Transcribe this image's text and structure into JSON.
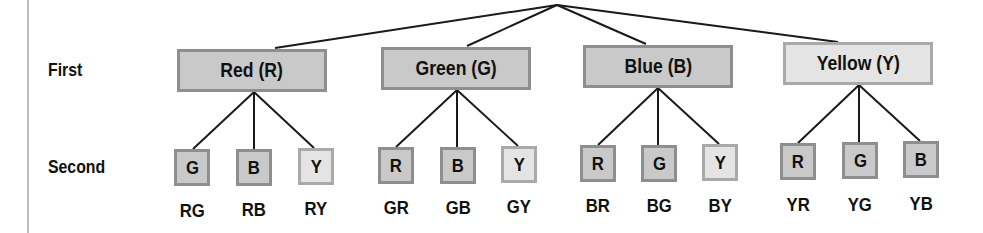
{
  "rows": {
    "first": "First",
    "second": "Second"
  },
  "first_level": [
    {
      "label": "Red (R)",
      "shade": "dark"
    },
    {
      "label": "Green (G)",
      "shade": "dark"
    },
    {
      "label": "Blue (B)",
      "shade": "dark"
    },
    {
      "label": "Yellow (Y)",
      "shade": "light"
    }
  ],
  "second_level": [
    [
      {
        "letter": "G",
        "combo": "RG",
        "shade": "dark"
      },
      {
        "letter": "B",
        "combo": "RB",
        "shade": "dark"
      },
      {
        "letter": "Y",
        "combo": "RY",
        "shade": "light"
      }
    ],
    [
      {
        "letter": "R",
        "combo": "GR",
        "shade": "dark"
      },
      {
        "letter": "B",
        "combo": "GB",
        "shade": "dark"
      },
      {
        "letter": "Y",
        "combo": "GY",
        "shade": "light"
      }
    ],
    [
      {
        "letter": "R",
        "combo": "BR",
        "shade": "dark"
      },
      {
        "letter": "G",
        "combo": "BG",
        "shade": "dark"
      },
      {
        "letter": "Y",
        "combo": "BY",
        "shade": "light"
      }
    ],
    [
      {
        "letter": "R",
        "combo": "YR",
        "shade": "dark"
      },
      {
        "letter": "G",
        "combo": "YG",
        "shade": "dark"
      },
      {
        "letter": "B",
        "combo": "YB",
        "shade": "dark"
      }
    ]
  ],
  "colors": {
    "dark_fill": "#c9c9c9",
    "light_fill": "#e4e4e4",
    "border": "#8e8e8e",
    "line": "#1a1a1a"
  }
}
